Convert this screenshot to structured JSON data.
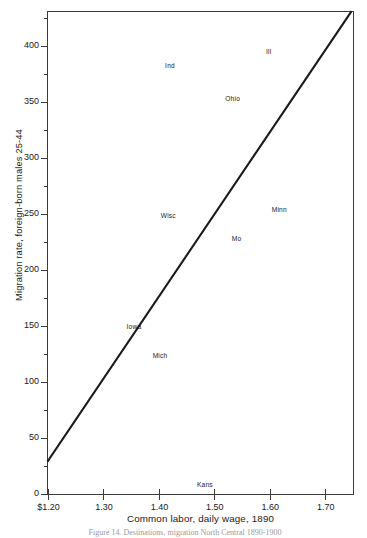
{
  "figure": {
    "caption": "Figure 14.  Destinations, migration North Central 1890-1900"
  },
  "chart_data": {
    "type": "scatter",
    "title": "",
    "xlabel": "Common labor, daily wage, 1890",
    "ylabel": "Migration rate, foreign-born males 25-44",
    "xlim": [
      1.2,
      1.75
    ],
    "ylim": [
      0,
      430
    ],
    "grid": false,
    "legend": "none",
    "xticks": [
      1.2,
      1.3,
      1.4,
      1.5,
      1.6,
      1.7
    ],
    "xtick_labels": [
      "$1.20",
      "1.30",
      "1.40",
      "1.50",
      "1.60",
      "1.70"
    ],
    "yticks": [
      0,
      50,
      100,
      150,
      200,
      250,
      300,
      350,
      400
    ],
    "ytick_labels": [
      "0",
      "50",
      "100",
      "150",
      "200",
      "250",
      "300",
      "350",
      "400"
    ],
    "ytick_minor_step": 25,
    "points": [
      {
        "label": "Ill",
        "x": 1.598,
        "y": 395
      },
      {
        "label": "Ind",
        "x": 1.42,
        "y": 383
      },
      {
        "label": "Ohio",
        "x": 1.533,
        "y": 353
      },
      {
        "label": "Wisc",
        "x": 1.417,
        "y": 249
      },
      {
        "label": "Minn",
        "x": 1.617,
        "y": 254
      },
      {
        "label": "Mo",
        "x": 1.54,
        "y": 228
      },
      {
        "label": "Iowa",
        "x": 1.355,
        "y": 150
      },
      {
        "label": "Mich",
        "x": 1.402,
        "y": 124
      },
      {
        "label": "Kans",
        "x": 1.483,
        "y": 9
      }
    ],
    "trend_line": {
      "name": "regression-line",
      "x_start": 1.2,
      "y_start": 28,
      "x_end": 1.75,
      "y_end": 430,
      "color": "#1a1a1a",
      "width": 2.1
    }
  }
}
